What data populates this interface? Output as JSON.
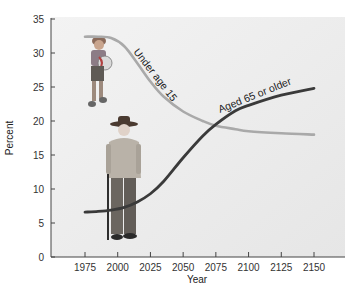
{
  "chart_data": {
    "type": "line",
    "title": "",
    "xlabel": "Year",
    "ylabel": "Percent",
    "xlim": [
      1955,
      2175
    ],
    "ylim": [
      0,
      35
    ],
    "x_ticks": [
      1975,
      2000,
      2025,
      2050,
      2075,
      2100,
      2125,
      2150
    ],
    "y_ticks": [
      0,
      5,
      10,
      15,
      20,
      25,
      30,
      35
    ],
    "grid": false,
    "legend": "inline labels on curves",
    "series": [
      {
        "name": "Under age 15",
        "color": "#a9a9a9",
        "x": [
          1975,
          1985,
          1995,
          2005,
          2015,
          2025,
          2035,
          2050,
          2065,
          2075,
          2090,
          2100,
          2125,
          2150
        ],
        "values": [
          32.4,
          32.4,
          32.2,
          31.0,
          28.5,
          25.8,
          23.6,
          21.4,
          20.0,
          19.3,
          18.8,
          18.5,
          18.2,
          18.0
        ]
      },
      {
        "name": "Aged 65 or older",
        "color": "#3a3a3a",
        "x": [
          1975,
          1985,
          1995,
          2005,
          2015,
          2025,
          2035,
          2050,
          2065,
          2075,
          2090,
          2100,
          2125,
          2150
        ],
        "values": [
          6.6,
          6.7,
          6.9,
          7.3,
          8.1,
          9.3,
          11.1,
          14.6,
          17.8,
          19.5,
          21.5,
          22.3,
          23.8,
          24.8
        ]
      }
    ],
    "annotations": [
      {
        "text": "Under age 15",
        "near": "declining gray curve, 2015-2035"
      },
      {
        "text": "Aged 65 or older",
        "near": "rising dark curve, 2075-2125"
      }
    ],
    "images": [
      "child holding beach ball (near under-15 start)",
      "elderly man with cane and hat (near 65+ start)"
    ]
  },
  "labels": {
    "under15": "Under age 15",
    "aged65": "Aged 65 or older",
    "xlabel": "Year",
    "ylabel": "Percent"
  }
}
